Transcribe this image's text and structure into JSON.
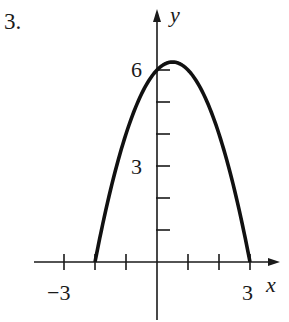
{
  "problem_number": "3.",
  "chart_data": {
    "type": "line",
    "title": "",
    "xlabel": "x",
    "ylabel": "y",
    "function": "y = -x^2 + x + 6",
    "x_range": [
      -2,
      3
    ],
    "xlim": [
      -3.5,
      4
    ],
    "ylim": [
      -1.8,
      7.3
    ],
    "x_ticks": [
      -3,
      -2,
      -1,
      0,
      1,
      2,
      3
    ],
    "x_tick_labels": {
      "-3": "−3",
      "3": "3"
    },
    "y_ticks": [
      1,
      2,
      3,
      4,
      5,
      6
    ],
    "y_tick_labels": {
      "3": "3",
      "6": "6"
    },
    "points": [
      {
        "x": -2,
        "y": 0
      },
      {
        "x": -1.5,
        "y": 2.25
      },
      {
        "x": -1,
        "y": 4
      },
      {
        "x": -0.5,
        "y": 5.25
      },
      {
        "x": 0,
        "y": 6
      },
      {
        "x": 0.5,
        "y": 6.25
      },
      {
        "x": 1,
        "y": 6
      },
      {
        "x": 1.5,
        "y": 5.25
      },
      {
        "x": 2,
        "y": 4
      },
      {
        "x": 2.5,
        "y": 2.25
      },
      {
        "x": 3,
        "y": 0
      }
    ],
    "grid": false,
    "legend": null
  },
  "labels": {
    "x_axis": "x",
    "y_axis": "y",
    "x_neg3": "−3",
    "x_3": "3",
    "y_3": "3",
    "y_6": "6"
  }
}
